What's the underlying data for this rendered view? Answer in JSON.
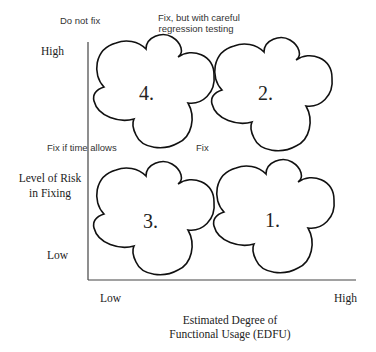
{
  "diagram": {
    "type": "2x2 quadrant matrix",
    "y_axis": {
      "title_line1": "Level of Risk",
      "title_line2": "in Fixing",
      "high_label": "High",
      "low_label": "Low"
    },
    "x_axis": {
      "title_line1": "Estimated Degree of",
      "title_line2": "Functional Usage (EDFU)",
      "low_label": "Low",
      "high_label": "High"
    },
    "quadrants": [
      {
        "id": "q4",
        "number": "4.",
        "position": "top-left",
        "label": "Do not fix"
      },
      {
        "id": "q2",
        "number": "2.",
        "position": "top-right",
        "label_line1": "Fix, but with careful",
        "label_line2": "regression testing"
      },
      {
        "id": "q3",
        "number": "3.",
        "position": "bottom-left",
        "label": "Fix if time allows"
      },
      {
        "id": "q1",
        "number": "1.",
        "position": "bottom-right",
        "label": "Fix"
      }
    ],
    "colors": {
      "stroke": "#111111",
      "axis": "#444444",
      "background": "#ffffff"
    }
  }
}
